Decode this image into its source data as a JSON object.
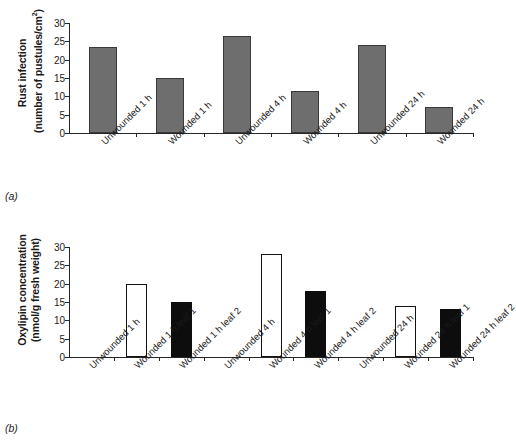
{
  "figure": {
    "panel_a_tag": "(a)",
    "panel_b_tag": "(b)"
  },
  "chart_data": [
    {
      "type": "bar",
      "panel": "(a)",
      "title": "",
      "xlabel": "",
      "ylabel": "Rust infection (number of pustules/cm2)",
      "ylabel_line1": "Rust infection",
      "ylabel_line2": "(number of pustules/cm",
      "ylabel_sup": "2",
      "ylabel_close": ")",
      "ylim": [
        0,
        30
      ],
      "yticks": [
        0,
        5,
        10,
        15,
        20,
        25,
        30
      ],
      "ytick_labels": [
        "0",
        "5",
        "10",
        "15",
        "20",
        "25",
        "30"
      ],
      "grid": false,
      "legend": "none",
      "categories": [
        "Unwounded 1 h",
        "Wounded 1 h",
        "Unwounded 4 h",
        "Wounded 4 h",
        "Unwounded 24 h",
        "Wounded 24 h"
      ],
      "values": [
        23.5,
        15,
        26.5,
        11.5,
        24,
        7
      ],
      "bar_styles": [
        "gray",
        "gray",
        "gray",
        "gray",
        "gray",
        "gray"
      ],
      "colors": {
        "gray_fill": "#6e6e6e",
        "gray_edge": "#3a3a3a"
      }
    },
    {
      "type": "bar",
      "panel": "(b)",
      "title": "",
      "xlabel": "",
      "ylabel": "Oxylipin concentration (nmol/g fresh weight)",
      "ylabel_line1": "Oxylipin concentration",
      "ylabel_line2": "(nmol/g fresh weight)",
      "ylim": [
        0,
        30
      ],
      "yticks": [
        0,
        5,
        10,
        15,
        20,
        25,
        30
      ],
      "ytick_labels": [
        "0",
        "5",
        "10",
        "15",
        "20",
        "25",
        "30"
      ],
      "grid": false,
      "legend": "none",
      "categories": [
        "Unwounded 1 h",
        "Wounded 1 h leaf 1",
        "Wounded 1 h leaf 2",
        "Unwounded 4 h",
        "Wounded 4 h leaf 1",
        "Wounded 4 h leaf 2",
        "Unwounded 24 h",
        "Wounded 24 h leaf 1",
        "Wounded 24 h leaf 2"
      ],
      "values": [
        0,
        20,
        15,
        0,
        28,
        18,
        0,
        14,
        13
      ],
      "bar_styles": [
        "none",
        "white",
        "black",
        "none",
        "white",
        "black",
        "none",
        "white",
        "black"
      ],
      "colors": {
        "white_fill": "#ffffff",
        "white_edge": "#111111",
        "black_fill": "#0d0d0d"
      }
    }
  ]
}
